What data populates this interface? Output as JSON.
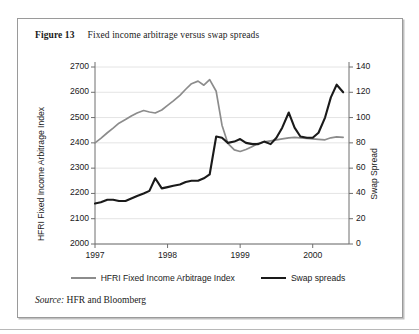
{
  "figure": {
    "label": "Figure 13",
    "caption": "Fixed income arbitrage versus swap spreads"
  },
  "source": {
    "prefix": "Source:",
    "text": "HFR and Bloomberg"
  },
  "legend": {
    "items": [
      {
        "label": "HFRI Fixed Income Arbitrage Index",
        "color": "#8c8c8c"
      },
      {
        "label": "Swap spreads",
        "color": "#1a1a1a"
      }
    ]
  },
  "chart_data": {
    "type": "line",
    "title": "Fixed income arbitrage versus swap spreads",
    "xlabel": "",
    "ylabel": "HFRI Fixed Income Arbitrage Index",
    "y2label": "Swap Spread",
    "xlim": [
      1997.0,
      2000.5
    ],
    "ylim": [
      2000,
      2700
    ],
    "y2lim": [
      0,
      140
    ],
    "grid": true,
    "legend_position": "bottom",
    "xticks": [
      "1997",
      "1998",
      "1999",
      "2000"
    ],
    "xtick_values": [
      1997,
      1998,
      1999,
      2000
    ],
    "yticks": [
      "2000",
      "2100",
      "2200",
      "2300",
      "2400",
      "2500",
      "2600",
      "2700"
    ],
    "ytick_values": [
      2000,
      2100,
      2200,
      2300,
      2400,
      2500,
      2600,
      2700
    ],
    "y2ticks": [
      "0",
      "20",
      "40",
      "60",
      "80",
      "100",
      "120",
      "140"
    ],
    "y2tick_values": [
      0,
      20,
      40,
      60,
      80,
      100,
      120,
      140
    ],
    "x": [
      1997.0,
      1997.08,
      1997.17,
      1997.25,
      1997.33,
      1997.42,
      1997.5,
      1997.58,
      1997.67,
      1997.75,
      1997.83,
      1997.92,
      1998.0,
      1998.08,
      1998.17,
      1998.25,
      1998.33,
      1998.42,
      1998.5,
      1998.58,
      1998.67,
      1998.75,
      1998.83,
      1998.92,
      1999.0,
      1999.08,
      1999.17,
      1999.25,
      1999.33,
      1999.42,
      1999.5,
      1999.58,
      1999.67,
      1999.75,
      1999.83,
      1999.92,
      2000.0,
      2000.08,
      2000.17,
      2000.25,
      2000.33,
      2000.42
    ],
    "series": [
      {
        "name": "HFRI Fixed Income Arbitrage Index",
        "axis": "left",
        "color": "#8c8c8c",
        "values": [
          2400,
          2418,
          2440,
          2458,
          2478,
          2492,
          2506,
          2518,
          2528,
          2522,
          2518,
          2530,
          2548,
          2566,
          2588,
          2612,
          2634,
          2644,
          2628,
          2650,
          2604,
          2470,
          2398,
          2372,
          2366,
          2374,
          2386,
          2398,
          2404,
          2408,
          2412,
          2416,
          2420,
          2422,
          2420,
          2418,
          2416,
          2414,
          2412,
          2420,
          2424,
          2422
        ]
      },
      {
        "name": "Swap spreads",
        "axis": "right",
        "color": "#1a1a1a",
        "values": [
          32,
          33,
          35,
          35,
          34,
          34,
          36,
          38,
          40,
          42,
          52,
          44,
          45,
          46,
          47,
          49,
          50,
          50,
          52,
          55,
          85,
          84,
          80,
          81,
          83,
          80,
          79,
          79,
          81,
          79,
          84,
          92,
          104,
          92,
          85,
          84,
          84,
          88,
          100,
          116,
          126,
          120
        ]
      }
    ]
  }
}
